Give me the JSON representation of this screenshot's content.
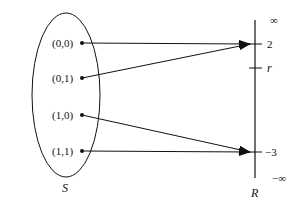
{
  "diagram": {
    "domain_set": {
      "label": "S",
      "elements": [
        "(0,0)",
        "(0,1)",
        "(1,0)",
        "(1,1)"
      ]
    },
    "codomain": {
      "label": "R",
      "top_label": "∞",
      "bottom_label": "−∞",
      "ticks": [
        {
          "label": "2"
        },
        {
          "label": "r"
        },
        {
          "label": "−3"
        }
      ]
    },
    "mappings": [
      {
        "from": "(0,0)",
        "to": "2"
      },
      {
        "from": "(0,1)",
        "to": "2"
      },
      {
        "from": "(1,0)",
        "to": "−3"
      },
      {
        "from": "(1,1)",
        "to": "−3"
      }
    ],
    "colors": {
      "ink": "#111111",
      "background": "#ffffff"
    }
  }
}
